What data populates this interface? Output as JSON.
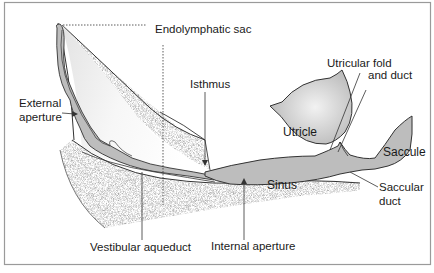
{
  "figure": {
    "type": "anatomical-diagram",
    "colors": {
      "background": "#ffffff",
      "frame": "#9a9a9a",
      "membranous_fill": "#bdbdbd",
      "bone_stipple": "#8a8a8a",
      "line": "#2a2a2a"
    }
  },
  "labels": {
    "endolymphatic_sac": "Endolymphatic sac",
    "isthmus": "Isthmus",
    "external_aperture_line1": "External",
    "external_aperture_line2": "aperture",
    "utricular_fold_line1": "Utricular fold",
    "utricular_fold_line2": "and duct",
    "utricle": "Utricle",
    "saccule": "Saccule",
    "sinus": "Sinus",
    "saccular_duct_line1": "Saccular",
    "saccular_duct_line2": "duct",
    "vestibular_aqueduct": "Vestibular aqueduct",
    "internal_aperture": "Internal aperture"
  }
}
